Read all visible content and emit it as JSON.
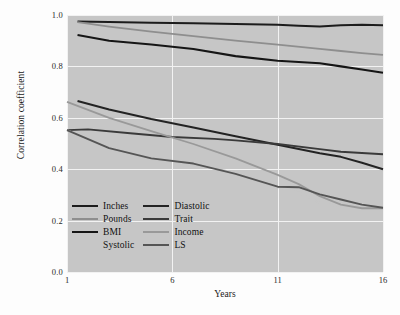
{
  "figure": {
    "background_color": "#fdfdfd",
    "plot_background_color": "#c6c6c6",
    "gridline_color": "#f2f2f2"
  },
  "caption": {
    "text": ""
  },
  "legend": {
    "left_column": [
      {
        "label": "Inches",
        "color": "#1c1c1c"
      },
      {
        "label": "Pounds",
        "color": "#8e8e8e"
      },
      {
        "label": "BMI",
        "color": "#151515"
      },
      {
        "label": "Systolic",
        "color": "#c6c6c6"
      }
    ],
    "right_column": [
      {
        "label": "Diastolic",
        "color": "#232323"
      },
      {
        "label": "Trait",
        "color": "#3a3a3a"
      },
      {
        "label": "Income",
        "color": "#999999"
      },
      {
        "label": "LS",
        "color": "#555555"
      }
    ]
  },
  "chart_data": {
    "type": "line",
    "title": "",
    "xlabel": "Years",
    "ylabel": "Correlation coefficient",
    "xlim": [
      1,
      16
    ],
    "ylim": [
      0.0,
      1.0
    ],
    "xticks": [
      "1",
      "6",
      "11",
      "16"
    ],
    "xtick_values": [
      1,
      6,
      11,
      16
    ],
    "yticks": [
      "0.0",
      "0.2",
      "0.4",
      "0.6",
      "0.8",
      "1.0"
    ],
    "ytick_values": [
      0.0,
      0.2,
      0.4,
      0.6,
      0.8,
      1.0
    ],
    "grid": true,
    "legend_position": "lower-left-inside",
    "series": [
      {
        "name": "Inches",
        "color": "#1c1c1c",
        "width": 2.0,
        "x": [
          1.5,
          3,
          5,
          7,
          9,
          11,
          12,
          13,
          14,
          15,
          16
        ],
        "values": [
          0.975,
          0.973,
          0.97,
          0.968,
          0.965,
          0.962,
          0.958,
          0.955,
          0.96,
          0.962,
          0.96
        ]
      },
      {
        "name": "Pounds",
        "color": "#8e8e8e",
        "width": 1.8,
        "x": [
          1.5,
          3,
          5,
          7,
          9,
          11,
          13,
          14,
          15,
          16
        ],
        "values": [
          0.972,
          0.955,
          0.935,
          0.918,
          0.9,
          0.885,
          0.868,
          0.86,
          0.852,
          0.845
        ]
      },
      {
        "name": "BMI",
        "color": "#151515",
        "width": 2.1,
        "x": [
          1.5,
          3,
          5,
          7,
          9,
          11,
          13,
          14,
          15,
          16
        ],
        "values": [
          0.922,
          0.9,
          0.885,
          0.868,
          0.84,
          0.822,
          0.812,
          0.8,
          0.788,
          0.775
        ]
      },
      {
        "name": "Diastolic",
        "color": "#232323",
        "width": 2.0,
        "x": [
          1.5,
          3,
          5,
          7,
          9,
          11,
          13,
          14,
          15,
          16
        ],
        "values": [
          0.665,
          0.632,
          0.595,
          0.562,
          0.528,
          0.495,
          0.462,
          0.448,
          0.425,
          0.4
        ]
      },
      {
        "name": "Trait",
        "color": "#3a3a3a",
        "width": 1.9,
        "x": [
          1,
          2,
          4,
          6,
          8,
          9,
          11,
          13,
          14,
          16
        ],
        "values": [
          0.552,
          0.555,
          0.54,
          0.525,
          0.518,
          0.512,
          0.498,
          0.478,
          0.468,
          0.458
        ]
      },
      {
        "name": "Systolic",
        "color": "#c6c6c6",
        "width": 1.8,
        "x": [
          1,
          3,
          5,
          7,
          9,
          11,
          12,
          13,
          14,
          15,
          16
        ],
        "values": [
          0.552,
          0.482,
          0.442,
          0.425,
          0.385,
          0.33,
          0.31,
          0.268,
          0.255,
          0.248,
          0.248
        ]
      },
      {
        "name": "Income",
        "color": "#999999",
        "width": 1.8,
        "x": [
          1,
          3,
          5,
          7,
          9,
          11,
          12,
          13,
          14,
          15,
          16
        ],
        "values": [
          0.662,
          0.6,
          0.548,
          0.498,
          0.442,
          0.378,
          0.342,
          0.295,
          0.262,
          0.248,
          0.248
        ]
      },
      {
        "name": "LS",
        "color": "#555555",
        "width": 1.9,
        "x": [
          1,
          3,
          5,
          7,
          9,
          11,
          12,
          13,
          14,
          15,
          16
        ],
        "values": [
          0.552,
          0.482,
          0.442,
          0.422,
          0.382,
          0.332,
          0.33,
          0.302,
          0.282,
          0.262,
          0.25
        ]
      }
    ]
  }
}
